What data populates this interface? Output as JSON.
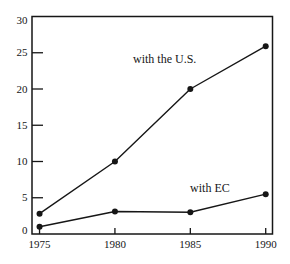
{
  "figure": {
    "background": "#ffffff",
    "ink": "#161616"
  },
  "chart_data": {
    "type": "line",
    "title": "",
    "xlabel": "",
    "ylabel": "",
    "x": [
      1975,
      1980,
      1985,
      1990
    ],
    "series": [
      {
        "name": "with the U.S.",
        "values": [
          2.8,
          10,
          20,
          25.9
        ]
      },
      {
        "name": "with EC",
        "values": [
          1.0,
          3.1,
          3.0,
          5.5
        ]
      }
    ],
    "xlim": [
      1974.5,
      1990.45
    ],
    "ylim": [
      0,
      30
    ],
    "xticks": [
      1975,
      1980,
      1985,
      1990
    ],
    "yticks": [
      0,
      5,
      10,
      15,
      20,
      25,
      30
    ],
    "grid": false,
    "marker": "filled-circle",
    "line_color": "#161616",
    "legend_position": "inline-annotations",
    "annotations": [
      {
        "text": "with the U.S.",
        "x": 1983.3,
        "y": 23.6,
        "anchor": "middle"
      },
      {
        "text": "with EC",
        "x": 1986.3,
        "y": 5.8,
        "anchor": "middle"
      }
    ]
  }
}
